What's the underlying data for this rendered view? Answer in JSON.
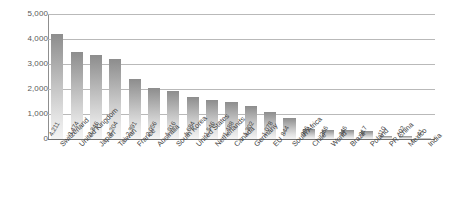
{
  "chart_data": {
    "type": "bar",
    "title": "",
    "subtitle": "",
    "xlabel": "",
    "ylabel": "",
    "ylim": [
      0,
      5000
    ],
    "yticks": [
      "0",
      "1,000",
      "2,000",
      "3,000",
      "4,000",
      "5,000"
    ],
    "ytick_values": [
      0,
      1000,
      2000,
      3000,
      4000,
      5000
    ],
    "grid": true,
    "legend": null,
    "legend_position": "none",
    "orientation": "vertical",
    "bar_color": "#a5a5a5",
    "bar_gradient_top": "#8d8d8d",
    "bar_gradient_bottom": "#f4f4f4",
    "gridline_color": "#b9b9b9",
    "axis_color": "#6f6f6f",
    "background": "#ffffff",
    "data_labels_shown": true,
    "categories": [
      "Switzerland",
      "United Kingdom",
      "Japan",
      "Taiwan",
      "France",
      "Australia",
      "South Korea",
      "United States",
      "Netherlands",
      "Canada",
      "Germany",
      "EU",
      "South Africa",
      "Chile",
      "World",
      "Brazil",
      "Poland",
      "PR China",
      "Mexico",
      "India"
    ],
    "values": [
      4211,
      3474,
      3346,
      3204,
      2391,
      2056,
      1916,
      1684,
      1546,
      1488,
      1302,
      1078,
      844,
      396,
      366,
      346,
      317,
      110,
      102,
      41
    ],
    "value_labels": [
      "4,211",
      "3,474",
      "3,346",
      "3,204",
      "2,391",
      "2,056",
      "1,916",
      "1,684",
      "1,546",
      "1,488",
      "1,302",
      "1,078",
      "844",
      "396",
      "366",
      "346",
      "317",
      "110",
      "102",
      "41"
    ]
  }
}
